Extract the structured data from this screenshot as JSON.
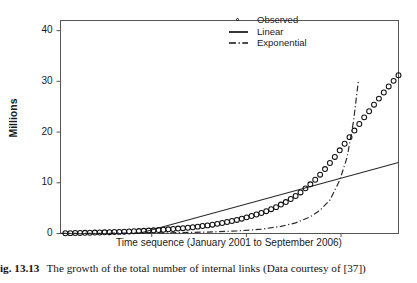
{
  "figure": {
    "caption_number": "ig. 13.13",
    "caption_text": "The growth of the total number of internal links (Data courtesy of [37])"
  },
  "legend": {
    "position": "top-right-inside",
    "items": [
      {
        "label": "Observed",
        "marker": "open-circle",
        "key": "circle-marker-icon"
      },
      {
        "label": "Linear",
        "marker": "solid-line",
        "key": "solid-line-icon"
      },
      {
        "label": "Exponential",
        "marker": "dash-dot-line",
        "key": "dash-dot-line-icon"
      }
    ]
  },
  "chart_data": {
    "type": "scatter",
    "title": "",
    "subtitle": "",
    "xlabel": "Time sequence (January 2001 to September 2006)",
    "ylabel": "Millions",
    "xlim": [
      0,
      69
    ],
    "ylim": [
      0,
      42
    ],
    "yticks": [
      0,
      10,
      20,
      30,
      40
    ],
    "ytick_labels": [
      "0",
      "10",
      "20",
      "30",
      "40"
    ],
    "xticks": [],
    "xtick_labels": [],
    "grid": false,
    "legend_position": "upper right",
    "colors": {
      "foreground": "#111111",
      "background": "#ffffff"
    },
    "series": [
      {
        "name": "Observed",
        "style": "open-circle-markers",
        "x": [
          1,
          2,
          3,
          4,
          5,
          6,
          7,
          8,
          9,
          10,
          11,
          12,
          13,
          14,
          15,
          16,
          17,
          18,
          19,
          20,
          21,
          22,
          23,
          24,
          25,
          26,
          27,
          28,
          29,
          30,
          31,
          32,
          33,
          34,
          35,
          36,
          37,
          38,
          39,
          40,
          41,
          42,
          43,
          44,
          45,
          46,
          47,
          48,
          49,
          50,
          51,
          52,
          53,
          54,
          55,
          56,
          57,
          58,
          59,
          60,
          61,
          62,
          63,
          64,
          65,
          66,
          67,
          68,
          69
        ],
        "y": [
          0.05,
          0.07,
          0.09,
          0.11,
          0.13,
          0.15,
          0.18,
          0.2,
          0.23,
          0.26,
          0.29,
          0.32,
          0.36,
          0.4,
          0.44,
          0.48,
          0.53,
          0.58,
          0.63,
          0.69,
          0.75,
          0.82,
          0.89,
          0.97,
          1.05,
          1.14,
          1.24,
          1.35,
          1.47,
          1.6,
          1.74,
          1.9,
          2.07,
          2.26,
          2.46,
          2.68,
          2.92,
          3.18,
          3.45,
          3.75,
          4.05,
          4.4,
          4.8,
          5.2,
          5.7,
          6.2,
          6.8,
          7.4,
          8.1,
          8.9,
          9.7,
          10.6,
          11.6,
          12.7,
          13.9,
          15.1,
          16.4,
          17.7,
          19.0,
          20.3,
          21.6,
          22.9,
          24.1,
          25.4,
          26.6,
          27.8,
          29.0,
          30.1,
          31.2
        ]
      },
      {
        "name": "Linear",
        "style": "solid-line",
        "x": [
          0,
          69
        ],
        "y": [
          -4.2,
          14.0
        ]
      },
      {
        "name": "Exponential",
        "style": "dash-dot-line",
        "x": [
          0,
          8,
          16,
          24,
          30,
          36,
          41,
          45,
          48,
          51,
          53,
          55,
          57,
          58.5,
          59.8,
          60.8
        ],
        "y": [
          0.02,
          0.04,
          0.08,
          0.16,
          0.28,
          0.5,
          0.85,
          1.4,
          2.1,
          3.3,
          4.6,
          6.6,
          10.5,
          15.0,
          22.0,
          30.0
        ]
      }
    ]
  }
}
